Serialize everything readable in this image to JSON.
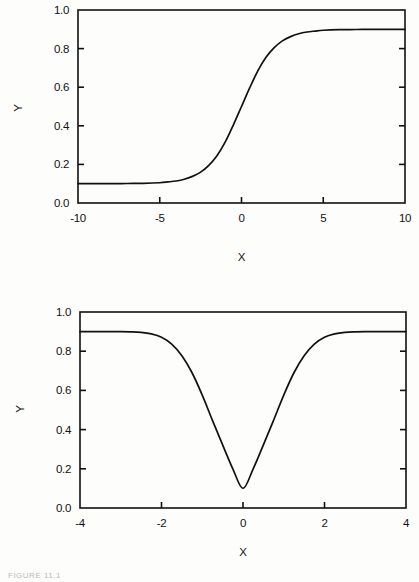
{
  "page": {
    "background_color": "#fdfdfc",
    "ink_color": "#111111",
    "caption": "FIGURE 11.1"
  },
  "chart_data": [
    {
      "id": "top",
      "type": "line",
      "title": "",
      "subtitle": "",
      "xlabel": "X",
      "ylabel": "Y",
      "xlim": [
        -10,
        10
      ],
      "ylim": [
        0.0,
        1.0
      ],
      "xticks": [
        -10,
        -5,
        0,
        5,
        10
      ],
      "xtick_labels": [
        "-10",
        "-5",
        "0",
        "5",
        "10"
      ],
      "yticks": [
        0.0,
        0.2,
        0.4,
        0.6,
        0.8,
        1.0
      ],
      "ytick_labels": [
        "0.0",
        "0.2",
        "0.4",
        "0.6",
        "0.8",
        "1.0"
      ],
      "grid": false,
      "legend": false,
      "legend_position": "none",
      "series": [
        {
          "name": "logistic",
          "description": "Logistic sigmoid rising from a lower plateau of 0.1 to an upper plateau of 0.9, midpoint at x = 0",
          "lower_plateau": 0.1,
          "upper_plateau": 0.9,
          "midpoint_x": 0,
          "steepness": 1.0,
          "x": [
            -10,
            -9,
            -8,
            -7,
            -6,
            -5,
            -4.5,
            -4,
            -3.5,
            -3,
            -2.5,
            -2,
            -1.5,
            -1,
            -0.5,
            0,
            0.5,
            1,
            1.5,
            2,
            2.5,
            3,
            3.5,
            4,
            4.5,
            5,
            6,
            7,
            8,
            9,
            10
          ],
          "values": [
            0.1,
            0.1,
            0.1,
            0.101,
            0.102,
            0.105,
            0.109,
            0.114,
            0.123,
            0.138,
            0.16,
            0.195,
            0.245,
            0.315,
            0.404,
            0.5,
            0.596,
            0.685,
            0.755,
            0.805,
            0.84,
            0.862,
            0.877,
            0.886,
            0.891,
            0.895,
            0.898,
            0.899,
            0.9,
            0.9,
            0.9
          ]
        }
      ]
    },
    {
      "id": "bottom",
      "type": "line",
      "title": "",
      "subtitle": "",
      "xlabel": "X",
      "ylabel": "Y",
      "xlim": [
        -4,
        4
      ],
      "ylim": [
        0.0,
        1.0
      ],
      "xticks": [
        -4,
        -2,
        0,
        2,
        4
      ],
      "xtick_labels": [
        "-4",
        "-2",
        "0",
        "2",
        "4"
      ],
      "yticks": [
        0.0,
        0.2,
        0.4,
        0.6,
        0.8,
        1.0
      ],
      "ytick_labels": [
        "0.0",
        "0.2",
        "0.4",
        "0.6",
        "0.8",
        "1.0"
      ],
      "grid": false,
      "legend": false,
      "legend_position": "none",
      "series": [
        {
          "name": "inverted-gaussian",
          "description": "Inverted Gaussian dip from a plateau of 0.9 down to a minimum of 0.1 at x = 0",
          "baseline": 0.9,
          "minimum": 0.1,
          "minimum_x": 0,
          "sigma": 0.55,
          "x": [
            -4,
            -3.5,
            -3,
            -2.75,
            -2.5,
            -2.25,
            -2,
            -1.75,
            -1.5,
            -1.25,
            -1,
            -0.75,
            -0.5,
            -0.25,
            0,
            0.25,
            0.5,
            0.75,
            1,
            1.25,
            1.5,
            1.75,
            2,
            2.25,
            2.5,
            2.75,
            3,
            3.5,
            4
          ],
          "values": [
            0.9,
            0.9,
            0.9,
            0.899,
            0.896,
            0.888,
            0.871,
            0.836,
            0.777,
            0.69,
            0.576,
            0.447,
            0.322,
            0.2,
            0.1,
            0.2,
            0.322,
            0.447,
            0.576,
            0.69,
            0.777,
            0.836,
            0.871,
            0.888,
            0.896,
            0.899,
            0.9,
            0.9,
            0.9
          ]
        }
      ]
    }
  ]
}
